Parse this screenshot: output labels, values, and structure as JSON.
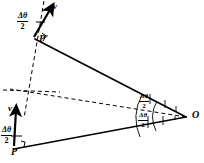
{
  "figure": {
    "type": "geometry-diagram",
    "background_color": "#ffffff",
    "stroke_color": "#000000",
    "width": 204,
    "height": 163
  },
  "points": {
    "center": {
      "label": "O",
      "x": 186,
      "y": 117
    },
    "p_prime": {
      "label": "P'",
      "x": 38,
      "y": 40
    },
    "p": {
      "label": "P",
      "x": 14,
      "y": 150
    }
  },
  "vectors": {
    "top": {
      "label": "v",
      "tip_x": 52,
      "tip_y": 6,
      "tail_x": 34,
      "tail_y": 36
    },
    "bottom": {
      "label": "v",
      "tip_x": 16,
      "tip_y": 112,
      "tail_x": 13,
      "tail_y": 146
    }
  },
  "angles": {
    "top_at_p_prime": {
      "numerator": "Δθ",
      "denominator": "2"
    },
    "bottom_at_p": {
      "numerator": "Δθ",
      "denominator": "2"
    },
    "upper_at_o": {
      "numerator": "Δθ",
      "denominator": "2"
    },
    "lower_at_o": {
      "numerator": "Δθ",
      "denominator": "2"
    }
  },
  "marks": {
    "right_angle_p_prime": true,
    "right_angle_p": true,
    "angle_arc_count": 2
  }
}
